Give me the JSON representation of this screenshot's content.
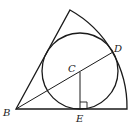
{
  "labels": {
    "B": "B",
    "C": "C",
    "D": "D",
    "E": "E"
  },
  "colors": {
    "stroke": "#1a1a1a"
  }
}
